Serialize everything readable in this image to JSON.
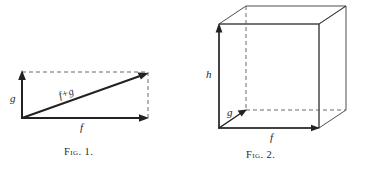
{
  "page": {
    "background_color": "#ffffff",
    "ink_color": "#222222",
    "width": 367,
    "height": 169
  },
  "figures": [
    {
      "id": "figure-1",
      "caption": "Fig. 1.",
      "description": "Vector addition parallelogram: vectors f and g with resultant f+g",
      "labels": {
        "vertical_vector": "g",
        "horizontal_vector": "f",
        "resultant_vector": "f+g"
      }
    },
    {
      "id": "figure-2",
      "caption": "Fig. 2.",
      "description": "Cube in oblique projection with edge vectors f, g and h",
      "labels": {
        "height_edge": "h",
        "depth_edge": "g",
        "width_edge": "f"
      }
    }
  ]
}
